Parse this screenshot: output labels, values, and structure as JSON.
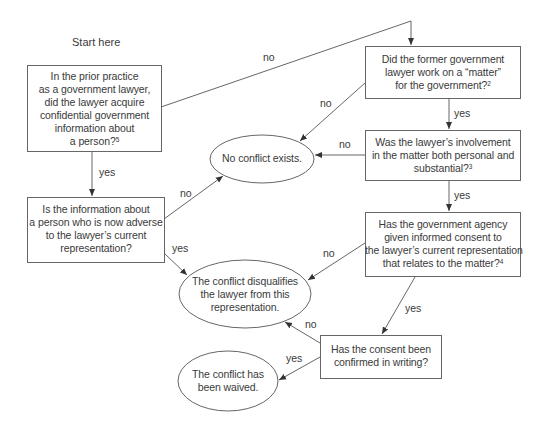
{
  "start_label": "Start here",
  "nodes": {
    "q1": {
      "type": "decision",
      "lines": [
        "In the prior practice",
        "as a government lawyer,",
        "did the lawyer acquire",
        "confidential government",
        "information about",
        "a person?"
      ],
      "footnote": "5"
    },
    "q2": {
      "type": "decision",
      "lines": [
        "Did the former government",
        "lawyer work on a “matter”",
        "for the government?"
      ],
      "footnote": "2"
    },
    "q3": {
      "type": "decision",
      "lines": [
        "Was the lawyer’s involvement",
        "in the matter both personal and",
        "substantial?"
      ],
      "footnote": "3"
    },
    "q4": {
      "type": "decision",
      "lines": [
        "Has the government agency",
        "given informed consent to",
        "the lawyer’s current representation",
        "that relates to the matter?"
      ],
      "footnote": "4"
    },
    "q5": {
      "type": "decision",
      "lines": [
        "Is the information about",
        "a person who is now adverse",
        "to the lawyer’s current",
        "representation?"
      ],
      "footnote": ""
    },
    "q6": {
      "type": "decision",
      "lines": [
        "Has the consent been",
        "confirmed in writing?"
      ],
      "footnote": ""
    },
    "r1": {
      "type": "outcome",
      "lines": [
        "No conflict exists."
      ]
    },
    "r2": {
      "type": "outcome",
      "lines": [
        "The conflict disqualifies",
        "the lawyer from this",
        "representation."
      ]
    },
    "r3": {
      "type": "outcome",
      "lines": [
        "The conflict has",
        "been waived."
      ]
    }
  },
  "edges": [
    {
      "from": "q1",
      "to": "q2",
      "label": "no"
    },
    {
      "from": "q1",
      "to": "q5",
      "label": "yes"
    },
    {
      "from": "q2",
      "to": "r1",
      "label": "no"
    },
    {
      "from": "q2",
      "to": "q3",
      "label": "yes"
    },
    {
      "from": "q3",
      "to": "r1",
      "label": "no"
    },
    {
      "from": "q3",
      "to": "q4",
      "label": "yes"
    },
    {
      "from": "q5",
      "to": "r1",
      "label": "no"
    },
    {
      "from": "q5",
      "to": "r2",
      "label": "yes"
    },
    {
      "from": "q4",
      "to": "r2",
      "label": "no"
    },
    {
      "from": "q4",
      "to": "q6",
      "label": "yes"
    },
    {
      "from": "q6",
      "to": "r2",
      "label": "no"
    },
    {
      "from": "q6",
      "to": "r3",
      "label": "yes"
    }
  ],
  "colors": {
    "stroke": "#555555",
    "text": "#3a3a3a",
    "background": "#ffffff"
  }
}
